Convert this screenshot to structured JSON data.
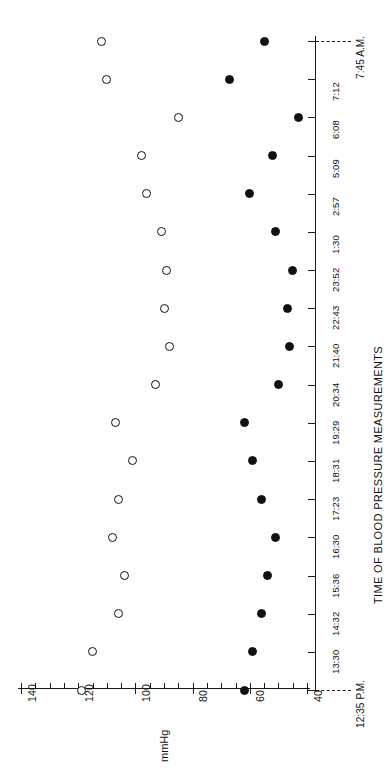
{
  "chart_data": {
    "type": "scatter",
    "title": "TIME OF BLOOD PRESSURE MEASUREMENTS",
    "xlabel": "mmHg",
    "ylabel": "TIME OF BLOOD PRESSURE MEASUREMENTS",
    "orientation": "rotated-90",
    "grid": false,
    "legend": null,
    "value_axis": {
      "name": "mmHg",
      "label": "mmHg",
      "range": [
        140,
        40
      ],
      "major_ticks": [
        140,
        120,
        100,
        80,
        60,
        40
      ],
      "major_tick_labels": [
        "140",
        "120",
        "100",
        "80",
        "60",
        "40"
      ],
      "minor_tick_step": 5,
      "direction": "decreasing-left-to-right"
    },
    "time_axis": {
      "name": "time",
      "categories": [
        "12:35 P.M.",
        "13:30",
        "14:32",
        "15:36",
        "16:30",
        "17:23",
        "18:31",
        "19:29",
        "20:34",
        "21:40",
        "22:43",
        "23:52",
        "1:30",
        "2:57",
        "5:09",
        "6:08",
        "7:12",
        "7:45 A.M."
      ],
      "start_label": "12:35 P.M.",
      "end_label": "7:45 A.M.",
      "direction": "bottom-to-top"
    },
    "categories": [
      "12:35 P.M.",
      "13:30",
      "14:32",
      "15:36",
      "16:30",
      "17:23",
      "18:31",
      "19:29",
      "20:34",
      "21:40",
      "22:43",
      "23:52",
      "1:30",
      "2:57",
      "5:09",
      "6:08",
      "7:12",
      "7:45 A.M."
    ],
    "series": [
      {
        "name": "systolic",
        "marker": "open-circle",
        "color": "#111111",
        "values": [
          119,
          115,
          106,
          104,
          108,
          106,
          101,
          107,
          93,
          88,
          90,
          89,
          91,
          96,
          98,
          85,
          110,
          112
        ]
      },
      {
        "name": "diastolic",
        "marker": "filled-circle",
        "color": "#111111",
        "values": [
          62,
          59,
          56,
          54,
          51,
          56,
          59,
          62,
          50,
          46,
          47,
          45,
          51,
          60,
          52,
          43,
          67,
          55
        ]
      }
    ]
  }
}
